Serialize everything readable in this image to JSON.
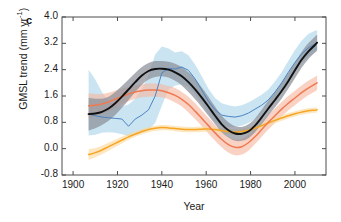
{
  "figure": {
    "panel_label": "c",
    "xlabel": "Year",
    "ylabel_text": "GMSL trend (mm yr",
    "ylabel_sup": "-1",
    "ylabel_close": ")"
  },
  "axes": {
    "xlim": [
      1895,
      2014
    ],
    "ylim": [
      -0.8,
      4.0
    ],
    "xticks": [
      1900,
      1920,
      1940,
      1960,
      1980,
      2000
    ],
    "xtick_labels": [
      "1900",
      "1920",
      "1940",
      "1960",
      "1980",
      "2000"
    ],
    "yticks": [
      -0.8,
      0.0,
      0.8,
      1.6,
      2.4,
      3.2,
      4.0
    ],
    "ytick_labels": [
      "-0.8",
      "0.0",
      "0.8",
      "1.6",
      "2.4",
      "3.2",
      "4.0"
    ],
    "grid": false,
    "tick_direction": "in",
    "box": true
  },
  "colors": {
    "black_line": "#111111",
    "gray_band": "#8a8f99",
    "blue_line": "#4b84c4",
    "blue_band": "#a9d3ea",
    "red_line": "#ef7a52",
    "red_band": "#f6b7a0",
    "orange_line": "#f5a623",
    "orange_band": "#fbd79a",
    "axis": "#4d4d4d",
    "text": "#1a1a1a"
  },
  "chart_data": {
    "type": "line",
    "title": "",
    "xlabel": "Year",
    "ylabel": "GMSL trend (mm yr^-1)",
    "xlim": [
      1895,
      2014
    ],
    "ylim": [
      -0.8,
      4.0
    ],
    "grid": false,
    "legend": "none",
    "x": [
      1907,
      1910,
      1913,
      1916,
      1919,
      1922,
      1925,
      1928,
      1931,
      1934,
      1937,
      1940,
      1943,
      1946,
      1949,
      1952,
      1955,
      1958,
      1961,
      1964,
      1967,
      1970,
      1973,
      1976,
      1979,
      1982,
      1985,
      1988,
      1991,
      1994,
      1997,
      2000,
      2003,
      2006,
      2009,
      2010
    ],
    "series": [
      {
        "name": "black-central-estimate",
        "color": "#111111",
        "style": "solid-thick",
        "has_band": true,
        "band_color": "#8a8f99",
        "values": [
          1.05,
          1.07,
          1.12,
          1.22,
          1.38,
          1.58,
          1.8,
          2.02,
          2.22,
          2.36,
          2.42,
          2.43,
          2.4,
          2.32,
          2.2,
          2.02,
          1.8,
          1.55,
          1.28,
          1.0,
          0.74,
          0.56,
          0.46,
          0.45,
          0.52,
          0.7,
          0.95,
          1.22,
          1.48,
          1.75,
          2.05,
          2.38,
          2.7,
          2.95,
          3.15,
          3.22
        ],
        "band_lower": [
          0.55,
          0.62,
          0.72,
          0.85,
          1.02,
          1.24,
          1.48,
          1.72,
          1.94,
          2.1,
          2.18,
          2.2,
          2.16,
          2.06,
          1.92,
          1.72,
          1.5,
          1.26,
          1.0,
          0.74,
          0.5,
          0.34,
          0.24,
          0.24,
          0.32,
          0.5,
          0.74,
          1.0,
          1.26,
          1.52,
          1.82,
          2.14,
          2.46,
          2.72,
          2.92,
          3.0
        ],
        "band_upper": [
          1.55,
          1.52,
          1.52,
          1.58,
          1.72,
          1.9,
          2.1,
          2.3,
          2.48,
          2.6,
          2.66,
          2.66,
          2.64,
          2.58,
          2.48,
          2.32,
          2.12,
          1.86,
          1.58,
          1.28,
          1.0,
          0.8,
          0.68,
          0.66,
          0.74,
          0.92,
          1.18,
          1.46,
          1.72,
          2.0,
          2.3,
          2.62,
          2.94,
          3.2,
          3.4,
          3.46
        ]
      },
      {
        "name": "blue-alternative-reconstruction",
        "color": "#4b84c4",
        "style": "solid-thin-jagged",
        "has_band": true,
        "band_color": "#a9d3ea",
        "values": [
          1.05,
          1.0,
          0.96,
          0.94,
          0.92,
          0.9,
          0.68,
          0.9,
          1.02,
          1.18,
          1.6,
          2.3,
          2.44,
          2.42,
          2.48,
          2.38,
          2.12,
          1.78,
          1.44,
          1.18,
          1.02,
          0.98,
          0.96,
          1.0,
          1.08,
          1.2,
          1.32,
          1.48,
          1.72,
          2.0,
          2.32,
          2.62,
          2.88,
          3.06,
          3.18,
          3.22
        ],
        "band_lower": [
          0.4,
          0.42,
          0.48,
          0.5,
          0.48,
          0.44,
          0.38,
          0.42,
          0.48,
          0.56,
          0.78,
          1.3,
          1.8,
          1.92,
          1.96,
          1.88,
          1.66,
          1.36,
          1.06,
          0.82,
          0.7,
          0.66,
          0.66,
          0.7,
          0.78,
          0.9,
          1.02,
          1.18,
          1.42,
          1.7,
          2.02,
          2.34,
          2.6,
          2.8,
          2.92,
          2.96
        ],
        "band_upper": [
          2.4,
          2.1,
          1.72,
          1.44,
          1.3,
          1.28,
          1.34,
          1.52,
          1.82,
          2.22,
          2.86,
          3.1,
          3.04,
          2.92,
          2.96,
          2.84,
          2.56,
          2.2,
          1.82,
          1.54,
          1.38,
          1.32,
          1.28,
          1.32,
          1.4,
          1.52,
          1.64,
          1.8,
          2.04,
          2.32,
          2.66,
          3.0,
          3.28,
          3.48,
          3.58,
          3.6
        ]
      },
      {
        "name": "red-reconstruction",
        "color": "#ef7a52",
        "style": "solid-medium",
        "has_band": true,
        "band_color": "#f6b7a0",
        "values": [
          1.3,
          1.32,
          1.36,
          1.42,
          1.5,
          1.58,
          1.66,
          1.72,
          1.76,
          1.78,
          1.78,
          1.76,
          1.7,
          1.62,
          1.5,
          1.34,
          1.14,
          0.92,
          0.7,
          0.48,
          0.28,
          0.12,
          0.04,
          0.06,
          0.18,
          0.36,
          0.58,
          0.8,
          1.0,
          1.2,
          1.38,
          1.54,
          1.7,
          1.84,
          1.96,
          2.0
        ],
        "band_lower": [
          0.92,
          0.98,
          1.06,
          1.14,
          1.24,
          1.34,
          1.44,
          1.52,
          1.56,
          1.58,
          1.58,
          1.56,
          1.5,
          1.4,
          1.28,
          1.1,
          0.9,
          0.68,
          0.46,
          0.24,
          0.04,
          -0.12,
          -0.2,
          -0.18,
          -0.06,
          0.14,
          0.36,
          0.58,
          0.78,
          0.98,
          1.16,
          1.32,
          1.48,
          1.62,
          1.74,
          1.78
        ],
        "band_upper": [
          1.68,
          1.66,
          1.66,
          1.7,
          1.76,
          1.82,
          1.88,
          1.92,
          1.96,
          1.98,
          1.98,
          1.96,
          1.9,
          1.84,
          1.72,
          1.58,
          1.38,
          1.16,
          0.94,
          0.72,
          0.52,
          0.36,
          0.28,
          0.3,
          0.42,
          0.58,
          0.8,
          1.02,
          1.22,
          1.42,
          1.6,
          1.76,
          1.92,
          2.06,
          2.18,
          2.22
        ]
      },
      {
        "name": "orange-reconstruction",
        "color": "#f5a623",
        "style": "solid-medium",
        "has_band": true,
        "band_color": "#fbd79a",
        "values": [
          -0.18,
          -0.12,
          -0.04,
          0.06,
          0.16,
          0.26,
          0.36,
          0.44,
          0.52,
          0.58,
          0.62,
          0.64,
          0.63,
          0.61,
          0.59,
          0.58,
          0.58,
          0.59,
          0.6,
          0.58,
          0.55,
          0.52,
          0.5,
          0.52,
          0.56,
          0.62,
          0.7,
          0.78,
          0.86,
          0.93,
          1.0,
          1.06,
          1.11,
          1.15,
          1.17,
          1.18
        ],
        "band_lower": [
          -0.34,
          -0.26,
          -0.17,
          -0.06,
          0.05,
          0.16,
          0.27,
          0.36,
          0.44,
          0.5,
          0.54,
          0.56,
          0.55,
          0.53,
          0.51,
          0.5,
          0.5,
          0.51,
          0.52,
          0.5,
          0.47,
          0.44,
          0.42,
          0.44,
          0.48,
          0.54,
          0.62,
          0.7,
          0.78,
          0.85,
          0.92,
          0.98,
          1.03,
          1.07,
          1.09,
          1.1
        ],
        "band_upper": [
          -0.02,
          0.02,
          0.09,
          0.18,
          0.27,
          0.36,
          0.45,
          0.52,
          0.6,
          0.66,
          0.7,
          0.72,
          0.71,
          0.69,
          0.67,
          0.66,
          0.66,
          0.67,
          0.68,
          0.66,
          0.63,
          0.6,
          0.58,
          0.6,
          0.64,
          0.7,
          0.78,
          0.86,
          0.94,
          1.01,
          1.08,
          1.14,
          1.19,
          1.23,
          1.25,
          1.26
        ]
      }
    ]
  }
}
